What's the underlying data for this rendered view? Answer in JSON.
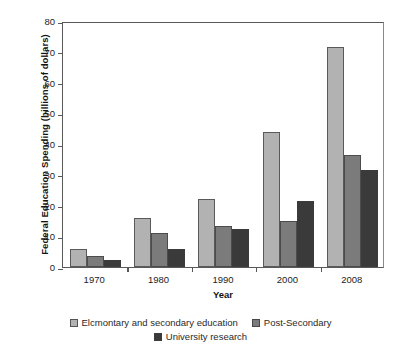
{
  "chart_data": {
    "type": "bar",
    "title": "",
    "xlabel": "Year",
    "ylabel": "Federal Education Spending (billions of dollars)",
    "categories": [
      "1970",
      "1980",
      "1990",
      "2000",
      "2008"
    ],
    "ylim": [
      0,
      80
    ],
    "yticks": [
      "0",
      "10",
      "20",
      "30",
      "40",
      "50",
      "60",
      "70",
      "80"
    ],
    "ytick_values": [
      0,
      10,
      20,
      30,
      40,
      50,
      60,
      70,
      80
    ],
    "grid": false,
    "legend_position": "bottom",
    "series": [
      {
        "name": "Elcmontary and secondary education",
        "color": "#b2b2b2",
        "values": [
          6,
          16,
          22,
          44,
          71.5
        ]
      },
      {
        "name": "Post-Secondary",
        "color": "#7b7b7b",
        "values": [
          3.5,
          11,
          13.5,
          15,
          36.5
        ]
      },
      {
        "name": "University research",
        "color": "#3a3a3a",
        "values": [
          2.3,
          6,
          12.5,
          21.5,
          31.5
        ]
      }
    ]
  },
  "axes": {
    "y_title": "Federal Education Spending (billions of dollars)",
    "x_title": "Year"
  },
  "legend": {
    "items": [
      {
        "label": "Elcmontary and secondary education",
        "color": "#b2b2b2"
      },
      {
        "label": "Post-Secondary",
        "color": "#7b7b7b"
      },
      {
        "label": "University research",
        "color": "#3a3a3a"
      }
    ]
  },
  "colors": {
    "series_light": "#b2b2b2",
    "series_medium": "#7b7b7b",
    "series_dark": "#3a3a3a",
    "axis": "#595959",
    "background": "#ffffff"
  }
}
